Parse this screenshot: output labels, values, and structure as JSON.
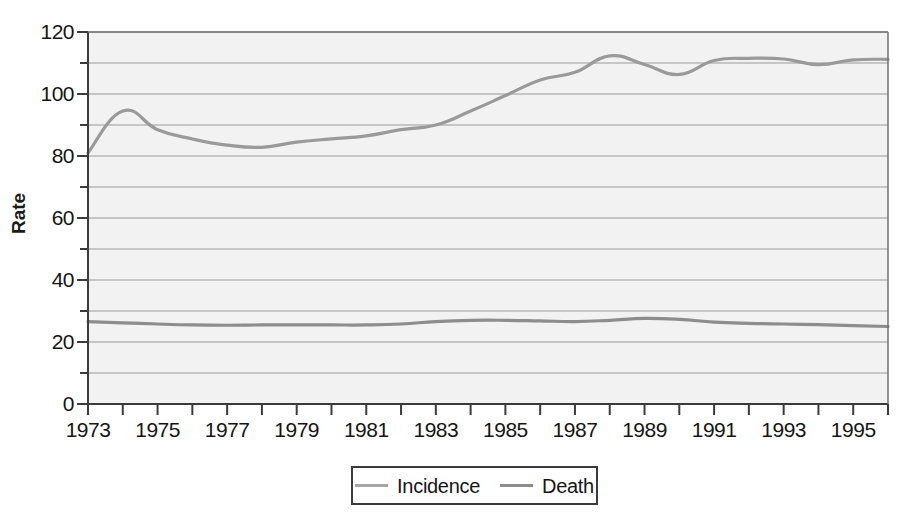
{
  "chart_data": {
    "type": "line",
    "title": "",
    "xlabel": "",
    "ylabel": "Rate",
    "xlim": [
      1973,
      1996
    ],
    "ylim": [
      0,
      120
    ],
    "grid": true,
    "grid_interval": 10,
    "y_major_ticks": [
      0,
      20,
      40,
      60,
      80,
      100,
      120
    ],
    "y_tick_labels": [
      "0",
      "20",
      "40",
      "60",
      "80",
      "100",
      "120"
    ],
    "y_minor_ticks": [
      10,
      30,
      50,
      70,
      90,
      110
    ],
    "x_ticks": [
      1973,
      1974,
      1975,
      1976,
      1977,
      1978,
      1979,
      1980,
      1981,
      1982,
      1983,
      1984,
      1985,
      1986,
      1987,
      1988,
      1989,
      1990,
      1991,
      1992,
      1993,
      1994,
      1995,
      1996
    ],
    "x_tick_labels": [
      "1973",
      "1975",
      "1977",
      "1979",
      "1981",
      "1983",
      "1985",
      "1987",
      "1989",
      "1991",
      "1993",
      "1995"
    ],
    "x_labeled_years": [
      1973,
      1975,
      1977,
      1979,
      1981,
      1983,
      1985,
      1987,
      1989,
      1991,
      1993,
      1995
    ],
    "legend_position": "bottom-center",
    "x": [
      1973,
      1974,
      1975,
      1976,
      1977,
      1978,
      1979,
      1980,
      1981,
      1982,
      1983,
      1984,
      1985,
      1986,
      1987,
      1988,
      1989,
      1990,
      1991,
      1992,
      1993,
      1994,
      1995,
      1996
    ],
    "series": [
      {
        "name": "Incidence",
        "color": "#9a9a9a",
        "values": [
          81.0,
          94.5,
          88.5,
          85.5,
          83.5,
          82.8,
          84.5,
          85.5,
          86.5,
          88.5,
          90.0,
          94.5,
          99.5,
          104.5,
          107.0,
          112.3,
          109.5,
          106.3,
          110.8,
          111.5,
          111.3,
          109.5,
          111.0,
          111.2
        ]
      },
      {
        "name": "Death",
        "color": "#8d8d8d",
        "values": [
          26.6,
          26.2,
          25.8,
          25.5,
          25.4,
          25.5,
          25.5,
          25.5,
          25.5,
          25.8,
          26.6,
          27.0,
          27.0,
          26.8,
          26.6,
          27.0,
          27.6,
          27.3,
          26.4,
          26.0,
          25.8,
          25.6,
          25.3,
          25.0
        ]
      }
    ]
  },
  "legend": {
    "entries": [
      {
        "label": "Incidence",
        "color": "#a6a6a6"
      },
      {
        "label": "Death",
        "color": "#8d8d8d"
      }
    ]
  },
  "axes": {
    "y_title": "Rate"
  },
  "style": {
    "plot_background": "#f2f2f2",
    "grid_color": "#8c8c8c",
    "axis_color": "#3b3b3b",
    "text_color": "#151515"
  }
}
